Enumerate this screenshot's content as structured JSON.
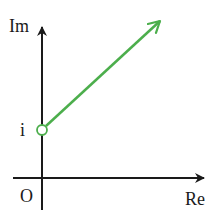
{
  "diagram": {
    "type": "complex-plane",
    "axes": {
      "real_label": "Re",
      "imaginary_label": "Im",
      "origin_label": "O",
      "axis_color": "#1a1a1a"
    },
    "points": [
      {
        "label": "i",
        "marker": "open-circle",
        "position": "on imaginary axis"
      }
    ],
    "rays": [
      {
        "from": "i",
        "direction": "up-right (45°)",
        "start_marker": "open-circle",
        "end_marker": "arrow",
        "color": "#4cae4c"
      }
    ]
  }
}
